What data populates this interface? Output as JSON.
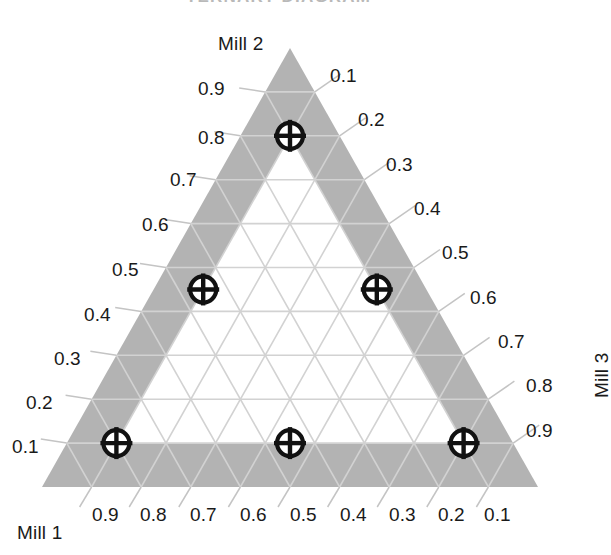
{
  "figure": {
    "background_color": "#ffffff",
    "band_color": "#b3b3b3",
    "interior_color": "#ffffff",
    "grid_color": "#d2d2d2",
    "marker_color": "#111111",
    "tick_leader_color": "#c2c2c2",
    "cropped_header_text": "TERNARY DIAGRAM"
  },
  "axes": {
    "left": {
      "title": "Mill 2",
      "title_position": "top-left",
      "ticks": [
        "0.1",
        "0.2",
        "0.3",
        "0.4",
        "0.5",
        "0.6",
        "0.7",
        "0.8",
        "0.9"
      ]
    },
    "right": {
      "title": "Mill 3",
      "title_position": "bottom-right",
      "title_rotation": -90,
      "ticks": [
        "0.1",
        "0.2",
        "0.3",
        "0.4",
        "0.5",
        "0.6",
        "0.7",
        "0.8",
        "0.9"
      ]
    },
    "bottom": {
      "title": "Mill 1",
      "title_position": "bottom-left",
      "ticks": [
        "0.9",
        "0.8",
        "0.7",
        "0.6",
        "0.5",
        "0.4",
        "0.3",
        "0.2",
        "0.1"
      ]
    }
  },
  "chart_data": {
    "type": "scatter",
    "subtype": "ternary",
    "title": "",
    "xlabel": "Mill 1",
    "ylabel": "Mill 2",
    "zlabel": "Mill 3",
    "grid": true,
    "grid_interval": 0.1,
    "axis_range": [
      0,
      1
    ],
    "legend": [],
    "marker_style": "crossed-circle",
    "components": [
      "Mill 1",
      "Mill 2",
      "Mill 3"
    ],
    "tick_values": [
      0.1,
      0.2,
      0.3,
      0.4,
      0.5,
      0.6,
      0.7,
      0.8,
      0.9
    ],
    "shaded_band_width": 0.1,
    "points": [
      {
        "label": "P1",
        "mill1": 0.1,
        "mill2": 0.8,
        "mill3": 0.1
      },
      {
        "label": "P2",
        "mill1": 0.45,
        "mill2": 0.45,
        "mill3": 0.1
      },
      {
        "label": "P3",
        "mill1": 0.1,
        "mill2": 0.45,
        "mill3": 0.45
      },
      {
        "label": "P4",
        "mill1": 0.8,
        "mill2": 0.1,
        "mill3": 0.1
      },
      {
        "label": "P5",
        "mill1": 0.45,
        "mill2": 0.1,
        "mill3": 0.45
      },
      {
        "label": "P6",
        "mill1": 0.1,
        "mill2": 0.1,
        "mill3": 0.8
      }
    ]
  },
  "geometry": {
    "apex": {
      "x": 290,
      "y": 48
    },
    "bottom_left": {
      "x": 42,
      "y": 487
    },
    "bottom_right": {
      "x": 538,
      "y": 487
    },
    "marker_radius": 13
  },
  "labels": {
    "left_ticks": [
      {
        "text": "0.9",
        "x": 198,
        "y": 79
      },
      {
        "text": "0.8",
        "x": 198,
        "y": 128
      },
      {
        "text": "0.7",
        "x": 170,
        "y": 170
      },
      {
        "text": "0.6",
        "x": 142,
        "y": 215
      },
      {
        "text": "0.5",
        "x": 112,
        "y": 260
      },
      {
        "text": "0.4",
        "x": 84,
        "y": 305
      },
      {
        "text": "0.3",
        "x": 54,
        "y": 349
      },
      {
        "text": "0.2",
        "x": 26,
        "y": 393
      },
      {
        "text": "0.1",
        "x": 12,
        "y": 437
      }
    ],
    "right_ticks": [
      {
        "text": "0.1",
        "x": 330,
        "y": 66
      },
      {
        "text": "0.2",
        "x": 358,
        "y": 110
      },
      {
        "text": "0.3",
        "x": 386,
        "y": 155
      },
      {
        "text": "0.4",
        "x": 414,
        "y": 199
      },
      {
        "text": "0.5",
        "x": 442,
        "y": 243
      },
      {
        "text": "0.6",
        "x": 470,
        "y": 288
      },
      {
        "text": "0.7",
        "x": 498,
        "y": 332
      },
      {
        "text": "0.8",
        "x": 526,
        "y": 376
      },
      {
        "text": "0.9",
        "x": 526,
        "y": 421
      }
    ],
    "bottom_ticks": [
      {
        "text": "0.9",
        "x": 92,
        "y": 505
      },
      {
        "text": "0.8",
        "x": 140,
        "y": 505
      },
      {
        "text": "0.7",
        "x": 190,
        "y": 505
      },
      {
        "text": "0.6",
        "x": 240,
        "y": 505
      },
      {
        "text": "0.5",
        "x": 290,
        "y": 505
      },
      {
        "text": "0.4",
        "x": 340,
        "y": 505
      },
      {
        "text": "0.3",
        "x": 389,
        "y": 505
      },
      {
        "text": "0.2",
        "x": 438,
        "y": 505
      },
      {
        "text": "0.1",
        "x": 484,
        "y": 505
      }
    ],
    "mill2_title": {
      "x": 218,
      "y": 34
    },
    "mill1_title": {
      "x": 17,
      "y": 523
    },
    "mill3_title": {
      "x": 592,
      "y": 398
    }
  }
}
